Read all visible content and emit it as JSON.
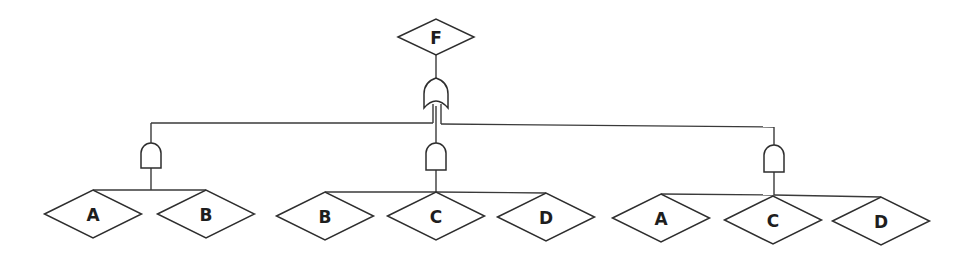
{
  "diagram": {
    "type": "fault-tree",
    "top_event": {
      "id": "F",
      "label": "F",
      "cx": 436,
      "cy": 37,
      "w": 76,
      "h": 36
    },
    "top_gate": {
      "type": "OR",
      "x": 436,
      "top": 78,
      "bottom": 108
    },
    "branches": [
      {
        "gate": {
          "type": "AND",
          "x": 151,
          "bus_y": 123,
          "top": 143,
          "bottom": 168,
          "base_y": 190
        },
        "events": [
          {
            "label": "A",
            "cx": 93,
            "cy": 214
          },
          {
            "label": "B",
            "cx": 206,
            "cy": 214
          }
        ]
      },
      {
        "gate": {
          "type": "AND",
          "x": 436,
          "bus_y": 123,
          "top": 143,
          "bottom": 170,
          "base_y": 192
        },
        "events": [
          {
            "label": "B",
            "cx": 325,
            "cy": 216
          },
          {
            "label": "C",
            "cx": 436,
            "cy": 216
          },
          {
            "label": "D",
            "cx": 546,
            "cy": 217
          }
        ]
      },
      {
        "gate": {
          "type": "AND",
          "x": 774,
          "bus_y": 127,
          "top": 145,
          "bottom": 172,
          "base_y": 195
        },
        "events": [
          {
            "label": "A",
            "cx": 661,
            "cy": 218
          },
          {
            "label": "C",
            "cx": 773,
            "cy": 220
          },
          {
            "label": "D",
            "cx": 881,
            "cy": 221
          }
        ]
      }
    ],
    "event_size": {
      "w": 97,
      "h": 48
    },
    "colors": {
      "line": "#2e2e2e",
      "fill": "#ffffff",
      "text": "#1e1e1e"
    }
  }
}
